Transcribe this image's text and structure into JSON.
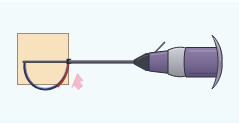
{
  "figure": {
    "type": "medical-instrument-illustration",
    "canvas": {
      "width": 239,
      "height": 123
    },
    "background_color": "#f2fafc"
  },
  "scene": {
    "tissue_block": {
      "label": "tissue-block",
      "fill_color": "#f8e2bd",
      "stroke_color": "#8a7352",
      "x": 17,
      "y": 33,
      "width": 52,
      "height": 52
    },
    "snare_loop": {
      "label": "snare-wire-loop",
      "stroke_color": "#2b3564",
      "highlight_color": "#b8352a",
      "crossbar_color": "#4a4a52",
      "shape": "u-shaped-wire",
      "apex_x": 45,
      "apex_y": 89,
      "left_x": 24,
      "right_x": 69,
      "top_y": 62
    },
    "shaft": {
      "label": "instrument-shaft",
      "color": "#5d5d66",
      "from_x": 69,
      "to_x": 136,
      "y": 62,
      "thickness": 3
    },
    "nose_cone": {
      "label": "shaft-nose-cone",
      "color": "#3f3f4c",
      "x": 136,
      "y": 62
    },
    "handle": {
      "label": "instrument-handle",
      "body_color": "#7b6c95",
      "shade_color": "#5e5277",
      "collar_color": "#b4b4bd",
      "outline_color": "#2f2f3a",
      "from_x": 140,
      "to_x": 218
    },
    "thumb_fin": {
      "label": "thumb-ring-fin",
      "color": "#9b93ac",
      "outline_color": "#3a3a46",
      "x": 214,
      "y": 61
    },
    "lever_antenna": {
      "label": "control-lever",
      "color": "#4a4a55",
      "x1": 150,
      "y1": 57,
      "x2": 163,
      "y2": 44
    },
    "motion_arrow": {
      "label": "motion-direction-arrow",
      "color": "#f7b9c9",
      "edge_color": "#f0a0b6",
      "direction": "down-left",
      "tip_x": 62,
      "tip_y": 86
    }
  },
  "legend": {
    "items": [
      {
        "name": "tissue-block",
        "color": "#f8e2bd"
      },
      {
        "name": "snare-wire-loop",
        "color": "#2b3564"
      },
      {
        "name": "instrument-handle",
        "color": "#7b6c95"
      },
      {
        "name": "motion-arrow",
        "color": "#f7b9c9"
      }
    ]
  }
}
